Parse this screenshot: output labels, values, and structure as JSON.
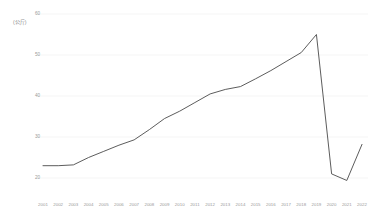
{
  "chart_data": {
    "type": "line",
    "title": "",
    "subtitle": "",
    "xlabel": "",
    "ylabel": "",
    "unit_label": "(公斤)",
    "grid": true,
    "legend": false,
    "legend_position": "none",
    "line_color": "#4a4a4a",
    "background_color": "#ffffff",
    "axis_text_color": "#9a9a9a",
    "gridline_color": "#f0f0f0",
    "xlim": [
      2001,
      2022
    ],
    "ylim": [
      15,
      61
    ],
    "yticks": [
      20,
      30,
      40,
      50,
      60
    ],
    "ytick_labels": [
      "20",
      "30",
      "40",
      "50",
      "60"
    ],
    "categories": [
      "2001",
      "2002",
      "2003",
      "2004",
      "2005",
      "2006",
      "2007",
      "2008",
      "2009",
      "2010",
      "2011",
      "2012",
      "2013",
      "2014",
      "2015",
      "2016",
      "2017",
      "2018",
      "2019",
      "2020",
      "2021",
      "2022"
    ],
    "series": [
      {
        "name": "value",
        "values": [
          23.0,
          23.0,
          23.2,
          25.0,
          26.5,
          28.0,
          29.3,
          31.8,
          34.5,
          36.3,
          38.4,
          40.5,
          41.6,
          42.3,
          44.2,
          46.2,
          48.4,
          50.6,
          55.0,
          21.0,
          19.4,
          28.2
        ]
      }
    ]
  }
}
